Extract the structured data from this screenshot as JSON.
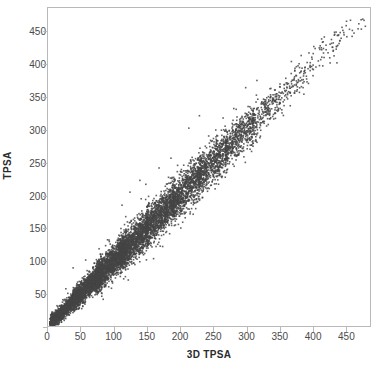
{
  "chart_data": {
    "type": "scatter",
    "title": "",
    "subtitle": "",
    "xlabel": "3D TPSA",
    "ylabel": "TPSA",
    "xlim": [
      0,
      487
    ],
    "ylim": [
      0,
      487
    ],
    "xticks": [
      0,
      50,
      100,
      150,
      200,
      250,
      300,
      350,
      400,
      450
    ],
    "yticks": [
      0,
      50,
      100,
      150,
      200,
      250,
      300,
      350,
      400,
      450
    ],
    "xticklabels": [
      "0",
      "50",
      "100",
      "150",
      "200",
      "250",
      "300",
      "350",
      "400",
      "450"
    ],
    "yticklabels": [
      "0",
      "50",
      "100",
      "150",
      "200",
      "250",
      "300",
      "350",
      "400",
      "450"
    ],
    "grid": false,
    "legend": null,
    "annotations": [],
    "marker": {
      "shape": "square",
      "size_px": 1.6,
      "color": "#454545",
      "opacity": 0.85
    },
    "frame_color": "#b9b9b9",
    "background": "#ffffff",
    "relationship": "strong positive linear, y approximately equals x",
    "n_points_approx": 9000,
    "series": [
      {
        "name": "compounds",
        "color": "#454545",
        "trend_slope": 1.0,
        "trend_intercept": 0.0,
        "x_range": [
          2,
          482
        ],
        "y_range": [
          2,
          470
        ],
        "density_profile": [
          {
            "x_center": 25,
            "spread": 6,
            "weight": 0.16
          },
          {
            "x_center": 60,
            "spread": 9,
            "weight": 0.17
          },
          {
            "x_center": 95,
            "spread": 12,
            "weight": 0.16
          },
          {
            "x_center": 130,
            "spread": 14,
            "weight": 0.14
          },
          {
            "x_center": 170,
            "spread": 15,
            "weight": 0.12
          },
          {
            "x_center": 210,
            "spread": 16,
            "weight": 0.09
          },
          {
            "x_center": 250,
            "spread": 16,
            "weight": 0.07
          },
          {
            "x_center": 290,
            "spread": 15,
            "weight": 0.05
          },
          {
            "x_center": 330,
            "spread": 14,
            "weight": 0.025
          },
          {
            "x_center": 375,
            "spread": 13,
            "weight": 0.012
          },
          {
            "x_center": 420,
            "spread": 12,
            "weight": 0.006
          },
          {
            "x_center": 465,
            "spread": 10,
            "weight": 0.003
          }
        ],
        "outliers": [
          {
            "x": 38,
            "y": 89
          },
          {
            "x": 27,
            "y": 57
          },
          {
            "x": 30,
            "y": 50
          },
          {
            "x": 57,
            "y": 101
          },
          {
            "x": 90,
            "y": 132
          },
          {
            "x": 112,
            "y": 185
          },
          {
            "x": 124,
            "y": 205
          },
          {
            "x": 139,
            "y": 223
          },
          {
            "x": 148,
            "y": 217
          },
          {
            "x": 168,
            "y": 242
          },
          {
            "x": 186,
            "y": 257
          },
          {
            "x": 196,
            "y": 246
          },
          {
            "x": 213,
            "y": 303
          },
          {
            "x": 229,
            "y": 322
          },
          {
            "x": 243,
            "y": 291
          },
          {
            "x": 262,
            "y": 229
          },
          {
            "x": 268,
            "y": 262
          },
          {
            "x": 281,
            "y": 333
          },
          {
            "x": 299,
            "y": 365
          },
          {
            "x": 306,
            "y": 303
          },
          {
            "x": 316,
            "y": 376
          },
          {
            "x": 344,
            "y": 318
          },
          {
            "x": 362,
            "y": 372
          },
          {
            "x": 387,
            "y": 355
          },
          {
            "x": 402,
            "y": 428
          },
          {
            "x": 414,
            "y": 423
          },
          {
            "x": 430,
            "y": 427
          },
          {
            "x": 437,
            "y": 403
          },
          {
            "x": 452,
            "y": 443
          },
          {
            "x": 476,
            "y": 470
          },
          {
            "x": 480,
            "y": 459
          }
        ]
      }
    ]
  },
  "axes": {
    "x": {
      "label": "3D TPSA",
      "tick_labels": [
        "0",
        "50",
        "100",
        "150",
        "200",
        "250",
        "300",
        "350",
        "400",
        "450"
      ]
    },
    "y": {
      "label": "TPSA",
      "tick_labels": [
        "0",
        "50",
        "100",
        "150",
        "200",
        "250",
        "300",
        "350",
        "400",
        "450"
      ]
    }
  }
}
